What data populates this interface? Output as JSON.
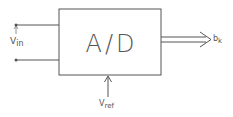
{
  "diagram": {
    "block": {
      "label": "A/D",
      "label_a": "A",
      "label_sep": "/",
      "label_d": "D"
    },
    "input": {
      "label_main": "V",
      "label_sub": "in"
    },
    "reference": {
      "label_main": "V",
      "label_sub": "ref"
    },
    "output": {
      "label_main": "b",
      "label_sub": "k"
    },
    "colors": {
      "line": "#555555",
      "text": "#777777",
      "background": "#ffffff"
    }
  }
}
